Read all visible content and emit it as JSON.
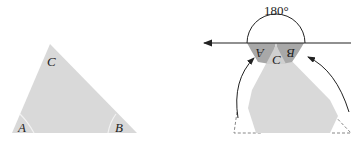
{
  "figure": {
    "left_triangle": {
      "labels": {
        "apex": "C",
        "bottom_left": "A",
        "bottom_right": "B"
      }
    },
    "right_figure": {
      "angle_label": "180°",
      "folded_labels": {
        "left_wedge": "A",
        "right_wedge": "B",
        "apex": "C"
      }
    }
  },
  "colors": {
    "triangle_fill": "#d9d9d9",
    "wedge_fill": "#a8a8a8",
    "line": "#222222",
    "dashed": "#888888"
  }
}
